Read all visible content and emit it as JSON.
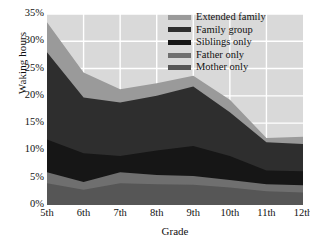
{
  "chart_data": {
    "type": "area",
    "stacked": true,
    "title": "",
    "xlabel": "Grade",
    "ylabel": "Waking hours",
    "categories": [
      "5th",
      "6th",
      "7th",
      "8th",
      "9th",
      "10th",
      "11th",
      "12th"
    ],
    "x_tick_labels": [
      "5th",
      "6th",
      "7th",
      "8th",
      "9th",
      "10th",
      "11th",
      "12th"
    ],
    "y_tick_labels": [
      "0%",
      "5%",
      "10%",
      "15%",
      "20%",
      "25%",
      "30%",
      "35%"
    ],
    "y_tick_values": [
      0,
      5,
      10,
      15,
      20,
      25,
      30,
      35
    ],
    "ylim": [
      0,
      35
    ],
    "y_unit": "%",
    "grid": true,
    "legend_position": "top-right",
    "series": [
      {
        "name": "Mother only",
        "color": "#565656",
        "values": [
          4.0,
          2.8,
          4.0,
          3.8,
          3.7,
          3.2,
          2.5,
          2.3
        ]
      },
      {
        "name": "Father only",
        "color": "#6f6f6f",
        "values": [
          2.0,
          1.4,
          2.0,
          1.7,
          1.6,
          1.4,
          1.3,
          1.3
        ]
      },
      {
        "name": "Siblings only",
        "color": "#161616",
        "values": [
          6.0,
          5.3,
          3.0,
          4.5,
          5.5,
          4.4,
          2.5,
          2.6
        ]
      },
      {
        "name": "Family group",
        "color": "#2e2e2e",
        "values": [
          16.0,
          10.2,
          9.8,
          10.0,
          10.9,
          8.0,
          5.2,
          5.0
        ]
      },
      {
        "name": "Extended family",
        "color": "#9a9a9a",
        "values": [
          5.5,
          4.6,
          2.4,
          2.3,
          2.0,
          2.3,
          0.8,
          1.3
        ]
      }
    ],
    "cumulative": {
      "mother_only": [
        4.0,
        2.8,
        4.0,
        3.8,
        3.7,
        3.2,
        2.5,
        2.3
      ],
      "father_only": [
        6.0,
        4.2,
        6.0,
        5.5,
        5.3,
        4.6,
        3.8,
        3.6
      ],
      "siblings_only": [
        12.0,
        9.5,
        9.0,
        10.0,
        10.8,
        9.0,
        6.3,
        6.2
      ],
      "family_group": [
        28.0,
        19.7,
        18.8,
        20.0,
        21.7,
        17.0,
        11.5,
        11.2
      ],
      "extended_family": [
        33.5,
        24.3,
        21.2,
        22.3,
        23.7,
        19.3,
        12.3,
        12.5
      ]
    },
    "legend_entries": [
      {
        "label": "Extended family",
        "color": "#9a9a9a"
      },
      {
        "label": "Family group",
        "color": "#2e2e2e"
      },
      {
        "label": "Siblings only",
        "color": "#161616"
      },
      {
        "label": "Father only",
        "color": "#6f6f6f"
      },
      {
        "label": "Mother only",
        "color": "#565656"
      }
    ],
    "plot_background": "#d9d9d9",
    "grid_color": "#ffffff",
    "figure_background": "#ffffff"
  }
}
